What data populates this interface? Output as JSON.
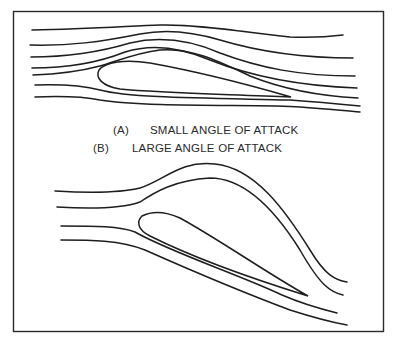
{
  "figure": {
    "caption_a": {
      "tag": "(A)",
      "text": "SMALL ANGLE OF ATTACK"
    },
    "caption_b": {
      "tag": "(B)",
      "text": "LARGE ANGLE OF ATTACK"
    },
    "stroke_color": "#1e1e1e",
    "background": "#ffffff"
  }
}
